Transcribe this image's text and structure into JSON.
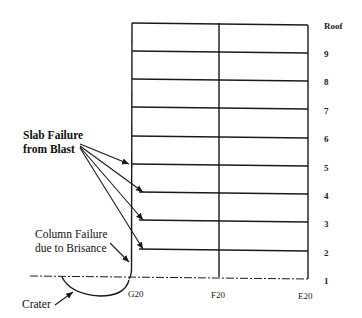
{
  "diagram": {
    "type": "building-elevation",
    "columns": [
      {
        "label": "G20",
        "x": 132
      },
      {
        "label": "F20",
        "x": 219
      },
      {
        "label": "E20",
        "x": 308
      }
    ],
    "floors": [
      {
        "label": "Roof",
        "y": 23
      },
      {
        "label": "9",
        "y": 51
      },
      {
        "label": "8",
        "y": 79
      },
      {
        "label": "7",
        "y": 107
      },
      {
        "label": "6",
        "y": 136
      },
      {
        "label": "5",
        "y": 164
      },
      {
        "label": "4",
        "y": 192
      },
      {
        "label": "3",
        "y": 220
      },
      {
        "label": "2",
        "y": 249
      },
      {
        "label": "1",
        "y": 277
      }
    ],
    "callouts": {
      "slab_failure_line1": "Slab Failure",
      "slab_failure_line2": "from Blast",
      "column_failure_line1": "Column Failure",
      "column_failure_line2": "due to Brisance",
      "crater": "Crater"
    },
    "labels": {
      "floor_roof": "Roof",
      "floor_9": "9",
      "floor_8": "8",
      "floor_7": "7",
      "floor_6": "6",
      "floor_5": "5",
      "floor_4": "4",
      "floor_3": "3",
      "floor_2": "2",
      "floor_1": "1",
      "col_g20": "G20",
      "col_f20": "F20",
      "col_e20": "E20"
    },
    "colors": {
      "line": "#1a1a1a",
      "background": "#ffffff"
    }
  }
}
